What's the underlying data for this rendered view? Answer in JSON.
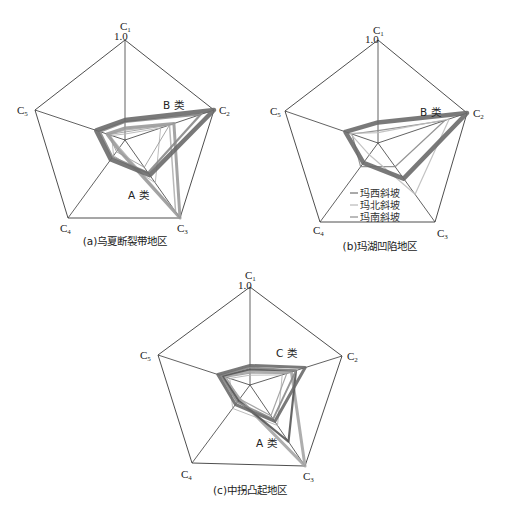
{
  "chart_data": [
    {
      "type": "radar",
      "title": "(a)乌夏断裂带地区",
      "axes": [
        "C1",
        "C2",
        "C3",
        "C4",
        "C5"
      ],
      "max_label": "1.0",
      "range": [
        0,
        1.0
      ],
      "geometry": {
        "center": [
          125,
          140
        ],
        "vertices": [
          [
            125,
            40
          ],
          [
            214,
            110
          ],
          [
            180,
            218
          ],
          [
            68,
            218
          ],
          [
            35,
            110
          ]
        ]
      },
      "annotations": [
        {
          "text": "B 类",
          "x": 163,
          "y": 106
        },
        {
          "text": "A 类",
          "x": 133,
          "y": 198
        }
      ],
      "series": [
        {
          "name": "B类",
          "color": "#6a6a6a",
          "width": 4.5,
          "values": [
            0.2,
            1.0,
            0.45,
            0.25,
            0.32
          ]
        },
        {
          "name": "B类-2",
          "color": "#8a8a8a",
          "width": 2.2,
          "values": [
            0.18,
            0.85,
            0.42,
            0.22,
            0.28
          ]
        },
        {
          "name": "A类",
          "color": "#9a9a9a",
          "width": 3.0,
          "values": [
            0.12,
            0.55,
            1.0,
            0.12,
            0.2
          ]
        },
        {
          "name": "A类-2",
          "color": "#b0b0b0",
          "width": 1.5,
          "values": [
            0.1,
            0.5,
            0.92,
            0.1,
            0.18
          ]
        },
        {
          "name": "inner",
          "color": "#9c9c9c",
          "width": 1.0,
          "values": [
            0.08,
            0.5,
            0.35,
            0.15,
            0.18
          ]
        },
        {
          "name": "inner-2",
          "color": "#b5b5b5",
          "width": 1.0,
          "values": [
            0.06,
            0.4,
            0.55,
            0.2,
            0.15
          ]
        }
      ]
    },
    {
      "type": "radar",
      "title": "(b)玛湖凹陷地区",
      "axes": [
        "C1",
        "C2",
        "C3",
        "C4",
        "C5"
      ],
      "max_label": "1.0",
      "range": [
        0,
        1.0
      ],
      "geometry": {
        "center": [
          378,
          143
        ],
        "vertices": [
          [
            378,
            40
          ],
          [
            467,
            113
          ],
          [
            435,
            222
          ],
          [
            320,
            222
          ],
          [
            285,
            111
          ]
        ]
      },
      "annotations": [
        {
          "text": "B 类",
          "x": 420,
          "y": 115
        }
      ],
      "legend": {
        "position": "lower-center",
        "entries": [
          "玛西斜坡",
          "玛北斜坡",
          "玛南斜坡"
        ],
        "colors": [
          "#555555",
          "#9a9a9a",
          "#777777"
        ]
      },
      "series": [
        {
          "name": "玛西斜坡",
          "color": "#6a6a6a",
          "width": 4.5,
          "values": [
            0.2,
            1.0,
            0.45,
            0.25,
            0.35
          ]
        },
        {
          "name": "玛北斜坡",
          "color": "#bdbdbd",
          "width": 1.2,
          "values": [
            0.1,
            0.8,
            0.65,
            0.15,
            0.3
          ]
        },
        {
          "name": "玛南斜坡",
          "color": "#8a8a8a",
          "width": 1.2,
          "values": [
            0.12,
            0.75,
            0.3,
            0.3,
            0.28
          ]
        }
      ]
    },
    {
      "type": "radar",
      "title": "(c)中拐凸起地区",
      "axes": [
        "C1",
        "C2",
        "C3",
        "C4",
        "C5"
      ],
      "max_label": "1.0",
      "range": [
        0,
        1.0
      ],
      "geometry": {
        "center": [
          250,
          385
        ],
        "vertices": [
          [
            250,
            287
          ],
          [
            342,
            356
          ],
          [
            305,
            466
          ],
          [
            192,
            463
          ],
          [
            158,
            355
          ]
        ]
      },
      "annotations": [
        {
          "text": "C 类",
          "x": 275,
          "y": 355
        },
        {
          "text": "A 类",
          "x": 258,
          "y": 446
        }
      ],
      "series": [
        {
          "name": "C类",
          "color": "#6a6a6a",
          "width": 3.0,
          "values": [
            0.2,
            0.6,
            0.45,
            0.25,
            0.35
          ]
        },
        {
          "name": "C类-2",
          "color": "#8a8a8a",
          "width": 1.8,
          "values": [
            0.18,
            0.5,
            0.42,
            0.22,
            0.32
          ]
        },
        {
          "name": "A类",
          "color": "#555555",
          "width": 2.2,
          "values": [
            0.16,
            0.5,
            0.7,
            0.2,
            0.3
          ]
        },
        {
          "name": "A类-2",
          "color": "#a5a5a5",
          "width": 3.0,
          "values": [
            0.14,
            0.45,
            1.0,
            0.18,
            0.3
          ]
        },
        {
          "name": "inner",
          "color": "#9c9c9c",
          "width": 1.2,
          "values": [
            0.12,
            0.4,
            0.38,
            0.18,
            0.26
          ]
        },
        {
          "name": "inner-2",
          "color": "#b5b5b5",
          "width": 1.0,
          "values": [
            0.1,
            0.35,
            0.5,
            0.3,
            0.22
          ]
        }
      ]
    }
  ],
  "charts": {
    "a": {
      "caption": "(a)乌夏断裂带地区",
      "max_label": "1.0",
      "label_b": "B 类",
      "label_a": "A 类"
    },
    "b": {
      "caption": "(b)玛湖凹陷地区",
      "max_label": "1.0",
      "label_b": "B 类",
      "legend": [
        "玛西斜坡",
        "玛北斜坡",
        "玛南斜坡"
      ]
    },
    "c": {
      "caption": "(c)中拐凸起地区",
      "max_label": "1.0",
      "label_c": "C 类",
      "label_a": "A 类"
    }
  },
  "axis_labels": {
    "c1": "C",
    "c1_sub": "1",
    "c2": "C",
    "c2_sub": "2",
    "c3": "C",
    "c3_sub": "3",
    "c4": "C",
    "c4_sub": "4",
    "c5": "C",
    "c5_sub": "5"
  }
}
